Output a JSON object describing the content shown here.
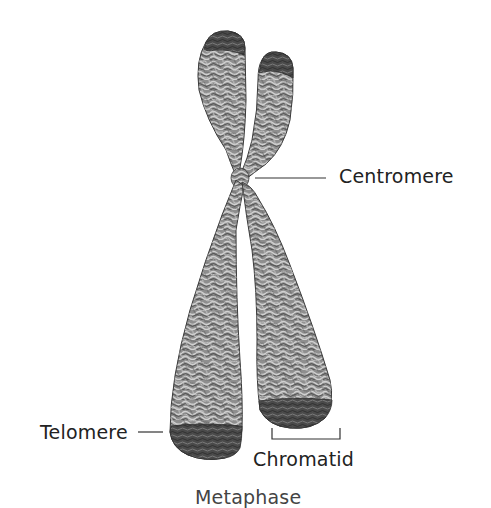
{
  "diagram": {
    "labels": {
      "centromere": "Centromere",
      "telomere": "Telomere",
      "chromatid": "Chromatid"
    },
    "caption_partial": "Metaphase",
    "colors": {
      "background": "#ffffff",
      "chromatin": "#8a8a8a",
      "chromatin_light": "#bdbdbd",
      "chromatin_dark": "#3c3c3c",
      "telomere_cap": "#454545",
      "leader_line": "#333333",
      "text": "#222222"
    }
  }
}
